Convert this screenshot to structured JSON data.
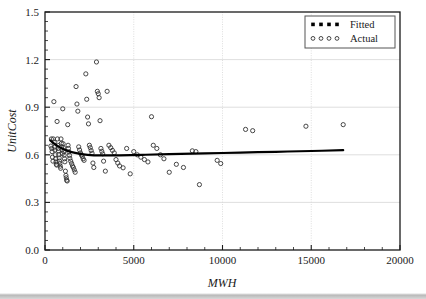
{
  "chart_data": {
    "type": "scatter",
    "title": "",
    "xlabel": "MWH",
    "ylabel": "UnitCost",
    "xlim": [
      0,
      20000
    ],
    "ylim": [
      0.0,
      1.5
    ],
    "xticks": [
      0,
      5000,
      10000,
      15000,
      20000
    ],
    "xtick_labels": [
      "0",
      "5000",
      "10000",
      "15000",
      "20000"
    ],
    "yticks": [
      0.0,
      0.3,
      0.6,
      0.9,
      1.2,
      1.5
    ],
    "ytick_labels": [
      "0.0",
      "0.3",
      "0.6",
      "0.9",
      "1.2",
      "1.5"
    ],
    "x_minor_per_major": 5,
    "y_minor_per_major": 5,
    "grid": true,
    "grid_color": "#d6d6d6",
    "legend_position": "top-right",
    "series": [
      {
        "name": "Actual",
        "marker": "open-circle",
        "color": "#333333",
        "points": [
          [
            330,
            0.655
          ],
          [
            360,
            0.7
          ],
          [
            380,
            0.64
          ],
          [
            400,
            0.62
          ],
          [
            420,
            0.585
          ],
          [
            450,
            0.56
          ],
          [
            470,
            0.7
          ],
          [
            500,
            0.935
          ],
          [
            520,
            0.68
          ],
          [
            540,
            0.648
          ],
          [
            560,
            0.63
          ],
          [
            580,
            0.6
          ],
          [
            600,
            0.575
          ],
          [
            620,
            0.555
          ],
          [
            640,
            0.54
          ],
          [
            660,
            0.535
          ],
          [
            680,
            0.81
          ],
          [
            700,
            0.7
          ],
          [
            720,
            0.66
          ],
          [
            740,
            0.64
          ],
          [
            760,
            0.625
          ],
          [
            780,
            0.6
          ],
          [
            800,
            0.58
          ],
          [
            820,
            0.56
          ],
          [
            840,
            0.545
          ],
          [
            860,
            0.528
          ],
          [
            880,
            0.515
          ],
          [
            900,
            0.7
          ],
          [
            920,
            0.672
          ],
          [
            940,
            0.65
          ],
          [
            960,
            0.63
          ],
          [
            980,
            0.608
          ],
          [
            1000,
            0.89
          ],
          [
            1020,
            0.67
          ],
          [
            1040,
            0.645
          ],
          [
            1060,
            0.62
          ],
          [
            1080,
            0.598
          ],
          [
            1100,
            0.575
          ],
          [
            1120,
            0.556
          ],
          [
            1150,
            0.497
          ],
          [
            1180,
            0.47
          ],
          [
            1200,
            0.455
          ],
          [
            1220,
            0.44
          ],
          [
            1250,
            0.435
          ],
          [
            1280,
            0.79
          ],
          [
            1300,
            0.66
          ],
          [
            1320,
            0.64
          ],
          [
            1350,
            0.618
          ],
          [
            1380,
            0.596
          ],
          [
            1400,
            0.578
          ],
          [
            1450,
            0.56
          ],
          [
            1500,
            0.545
          ],
          [
            1550,
            0.53
          ],
          [
            1600,
            0.52
          ],
          [
            1650,
            0.505
          ],
          [
            1700,
            0.49
          ],
          [
            1750,
            1.03
          ],
          [
            1800,
            0.92
          ],
          [
            1850,
            0.875
          ],
          [
            1900,
            0.65
          ],
          [
            1950,
            0.63
          ],
          [
            2000,
            0.612
          ],
          [
            2050,
            0.6
          ],
          [
            2100,
            0.59
          ],
          [
            2150,
            0.575
          ],
          [
            2200,
            0.565
          ],
          [
            2300,
            1.11
          ],
          [
            2350,
            0.95
          ],
          [
            2400,
            0.838
          ],
          [
            2450,
            0.795
          ],
          [
            2500,
            0.66
          ],
          [
            2550,
            0.645
          ],
          [
            2600,
            0.627
          ],
          [
            2650,
            0.61
          ],
          [
            2700,
            0.548
          ],
          [
            2750,
            0.52
          ],
          [
            2900,
            1.185
          ],
          [
            2950,
            1.0
          ],
          [
            3000,
            0.985
          ],
          [
            3050,
            0.96
          ],
          [
            3100,
            0.815
          ],
          [
            3150,
            0.64
          ],
          [
            3200,
            0.622
          ],
          [
            3250,
            0.606
          ],
          [
            3300,
            0.56
          ],
          [
            3400,
            0.497
          ],
          [
            3500,
            1.0
          ],
          [
            3600,
            0.66
          ],
          [
            3700,
            0.645
          ],
          [
            3800,
            0.628
          ],
          [
            3900,
            0.612
          ],
          [
            4000,
            0.57
          ],
          [
            4100,
            0.548
          ],
          [
            4200,
            0.53
          ],
          [
            4400,
            0.518
          ],
          [
            4600,
            0.64
          ],
          [
            4800,
            0.48
          ],
          [
            5000,
            0.62
          ],
          [
            5200,
            0.6
          ],
          [
            5400,
            0.585
          ],
          [
            5600,
            0.57
          ],
          [
            5800,
            0.555
          ],
          [
            6000,
            0.84
          ],
          [
            6100,
            0.66
          ],
          [
            6300,
            0.64
          ],
          [
            6500,
            0.6
          ],
          [
            6700,
            0.575
          ],
          [
            7000,
            0.49
          ],
          [
            7400,
            0.54
          ],
          [
            7800,
            0.52
          ],
          [
            8300,
            0.625
          ],
          [
            8500,
            0.62
          ],
          [
            8700,
            0.412
          ],
          [
            9700,
            0.565
          ],
          [
            9900,
            0.545
          ],
          [
            11300,
            0.76
          ],
          [
            11700,
            0.752
          ],
          [
            14700,
            0.78
          ],
          [
            16800,
            0.79
          ]
        ]
      },
      {
        "name": "Fitted",
        "marker": "dashed-line",
        "color": "#000000",
        "line": [
          [
            300,
            0.69
          ],
          [
            500,
            0.672
          ],
          [
            800,
            0.65
          ],
          [
            1200,
            0.628
          ],
          [
            1700,
            0.612
          ],
          [
            2400,
            0.6
          ],
          [
            3200,
            0.596
          ],
          [
            4200,
            0.597
          ],
          [
            5500,
            0.6
          ],
          [
            7000,
            0.604
          ],
          [
            9000,
            0.609
          ],
          [
            11000,
            0.614
          ],
          [
            13000,
            0.619
          ],
          [
            15000,
            0.624
          ],
          [
            16800,
            0.629
          ]
        ]
      }
    ],
    "legend_entries": [
      {
        "label": "Fitted",
        "marker": "squares"
      },
      {
        "label": "Actual",
        "marker": "circles"
      }
    ]
  },
  "axes": {
    "x_title": "MWH",
    "y_title": "UnitCost"
  }
}
